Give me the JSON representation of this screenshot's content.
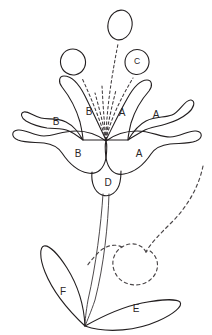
{
  "figure": {
    "background_color": "#ffffff",
    "stroke_color": "#231f20",
    "dashed_stroke_color": "#403c3e",
    "label_color": "#2a2628",
    "width": 212,
    "height": 335
  },
  "labels": [
    {
      "id": "label-b-upper-left",
      "text": "B",
      "x": 56,
      "y": 122
    },
    {
      "id": "label-b-upper-mid",
      "text": "B",
      "x": 89,
      "y": 112
    },
    {
      "id": "label-a-upper-mid",
      "text": "A",
      "x": 122,
      "y": 113
    },
    {
      "id": "label-a-upper-right",
      "text": "A",
      "x": 156,
      "y": 115
    },
    {
      "id": "label-b-lower-left",
      "text": "B",
      "x": 78,
      "y": 154
    },
    {
      "id": "label-a-lower-right",
      "text": "A",
      "x": 139,
      "y": 154
    },
    {
      "id": "label-c-anther",
      "text": "C",
      "x": 137,
      "y": 62
    },
    {
      "id": "label-d-ovary",
      "text": "D",
      "x": 108,
      "y": 183
    },
    {
      "id": "label-e-leaf-right",
      "text": "E",
      "x": 136,
      "y": 309
    },
    {
      "id": "label-f-leaf-left",
      "text": "F",
      "x": 63,
      "y": 292
    }
  ],
  "parts": {
    "anther_top": "anther-ellipse-top",
    "anther_left": "anther-ellipse-left",
    "anther_right": "anther-ellipse-right-c",
    "petal_upper_left": "petal-upper-left-b",
    "petal_upper_mid_l": "petal-upper-mid-left-b",
    "petal_upper_mid_r": "petal-upper-mid-right-a",
    "petal_upper_right": "petal-upper-right-a",
    "petal_lower_left": "petal-lower-left-b",
    "petal_lower_right": "petal-lower-right-a",
    "ovary": "ovary-d",
    "stem": "stem",
    "leaf_left": "leaf-left-f",
    "leaf_right": "leaf-right-e",
    "tendril": "dashed-tendril-loop",
    "filaments": "dashed-stamen-filaments"
  }
}
